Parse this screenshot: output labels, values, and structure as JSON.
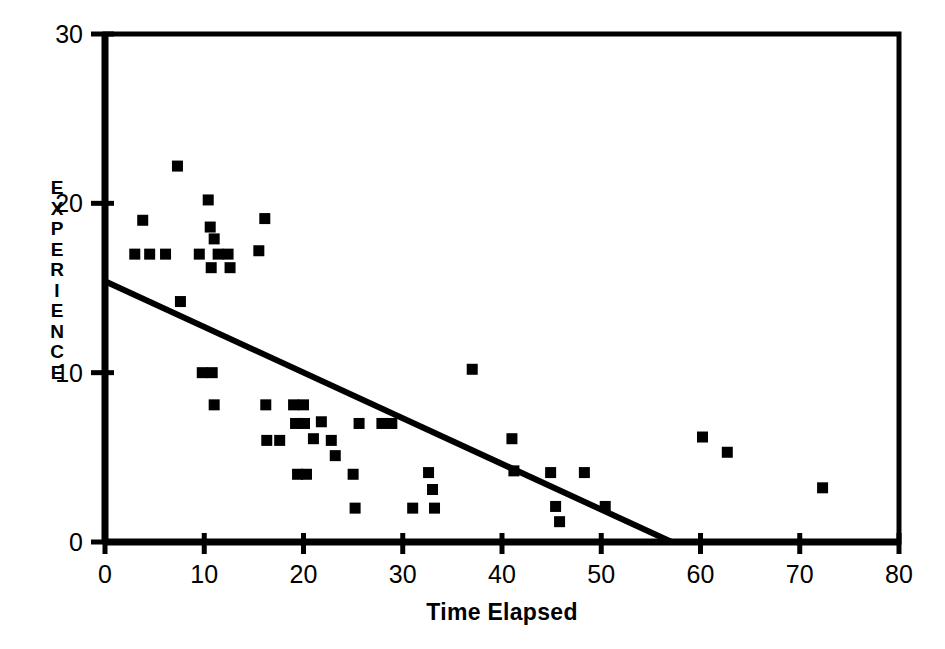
{
  "chart_data": {
    "type": "scatter",
    "title": "",
    "subtitle": "",
    "xlabel": "Time Elapsed",
    "ylabel": "EXPERIENCE",
    "xlim": [
      0,
      80
    ],
    "ylim": [
      0,
      30
    ],
    "xticks": [
      0,
      10,
      20,
      30,
      40,
      50,
      60,
      70,
      80
    ],
    "yticks": [
      0,
      10,
      20,
      30
    ],
    "xtick_labels": [
      "0",
      "10",
      "20",
      "30",
      "40",
      "50",
      "60",
      "70",
      "80"
    ],
    "ytick_labels": [
      "0",
      "10",
      "20",
      "30"
    ],
    "grid": false,
    "legend": false,
    "legend_position": "none",
    "marker": "square",
    "marker_color": "#000000",
    "marker_size": 11,
    "axis_color": "#000000",
    "background_color": "#ffffff",
    "frame": "box",
    "points": [
      {
        "x": 3.0,
        "y": 17.0
      },
      {
        "x": 3.8,
        "y": 19.0
      },
      {
        "x": 4.5,
        "y": 17.0
      },
      {
        "x": 6.1,
        "y": 17.0
      },
      {
        "x": 7.3,
        "y": 22.2
      },
      {
        "x": 7.6,
        "y": 14.2
      },
      {
        "x": 9.5,
        "y": 17.0
      },
      {
        "x": 9.8,
        "y": 10.0
      },
      {
        "x": 10.4,
        "y": 20.2
      },
      {
        "x": 10.6,
        "y": 18.6
      },
      {
        "x": 10.7,
        "y": 16.2
      },
      {
        "x": 10.8,
        "y": 10.0
      },
      {
        "x": 11.0,
        "y": 17.9
      },
      {
        "x": 11.0,
        "y": 8.1
      },
      {
        "x": 11.4,
        "y": 17.0
      },
      {
        "x": 12.4,
        "y": 17.0
      },
      {
        "x": 12.6,
        "y": 16.2
      },
      {
        "x": 15.5,
        "y": 17.2
      },
      {
        "x": 16.1,
        "y": 19.1
      },
      {
        "x": 16.2,
        "y": 8.1
      },
      {
        "x": 16.3,
        "y": 6.0
      },
      {
        "x": 17.6,
        "y": 6.0
      },
      {
        "x": 19.0,
        "y": 8.1
      },
      {
        "x": 19.2,
        "y": 7.0
      },
      {
        "x": 19.4,
        "y": 4.0
      },
      {
        "x": 20.0,
        "y": 8.1
      },
      {
        "x": 20.1,
        "y": 7.0
      },
      {
        "x": 20.3,
        "y": 4.0
      },
      {
        "x": 21.0,
        "y": 6.1
      },
      {
        "x": 21.8,
        "y": 7.1
      },
      {
        "x": 22.8,
        "y": 6.0
      },
      {
        "x": 23.2,
        "y": 5.1
      },
      {
        "x": 25.0,
        "y": 4.0
      },
      {
        "x": 25.2,
        "y": 2.0
      },
      {
        "x": 25.6,
        "y": 7.0
      },
      {
        "x": 27.9,
        "y": 7.0
      },
      {
        "x": 28.9,
        "y": 7.0
      },
      {
        "x": 31.0,
        "y": 2.0
      },
      {
        "x": 32.6,
        "y": 4.1
      },
      {
        "x": 33.0,
        "y": 3.1
      },
      {
        "x": 33.2,
        "y": 2.0
      },
      {
        "x": 37.0,
        "y": 10.2
      },
      {
        "x": 41.0,
        "y": 6.1
      },
      {
        "x": 41.2,
        "y": 4.2
      },
      {
        "x": 44.9,
        "y": 4.1
      },
      {
        "x": 45.4,
        "y": 2.1
      },
      {
        "x": 45.8,
        "y": 1.2
      },
      {
        "x": 48.3,
        "y": 4.1
      },
      {
        "x": 50.4,
        "y": 2.1
      },
      {
        "x": 60.2,
        "y": 6.2
      },
      {
        "x": 62.7,
        "y": 5.3
      },
      {
        "x": 72.3,
        "y": 3.2
      }
    ],
    "trendline": {
      "type": "line",
      "x": [
        0,
        57.1
      ],
      "y": [
        15.4,
        0
      ],
      "color": "#000000",
      "width": 6
    }
  }
}
